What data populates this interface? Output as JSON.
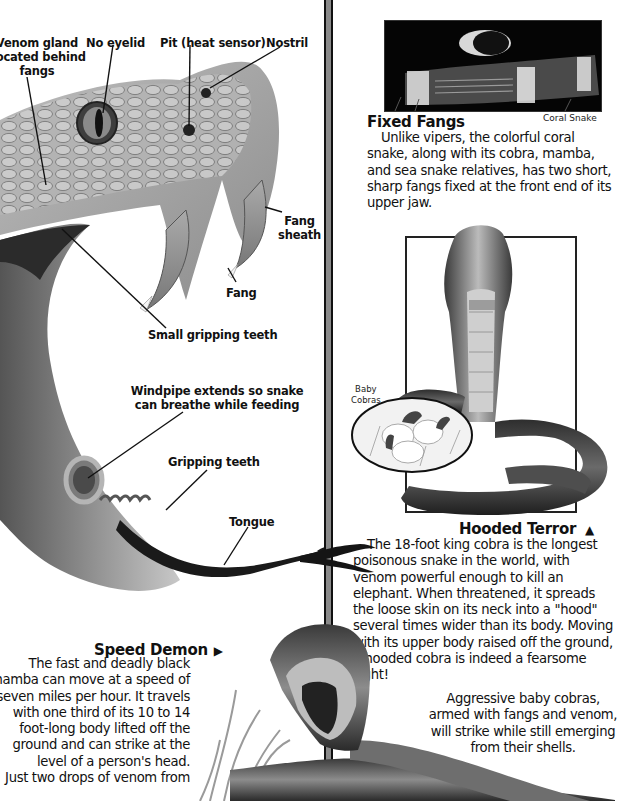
{
  "page": {
    "background": "#ffffff",
    "divider_color": "#8a8a8a"
  },
  "anatomy_diagram": {
    "labels": {
      "venom_gland": [
        "Venom gland",
        "located behind",
        "fangs"
      ],
      "no_eyelid": "No eyelid",
      "pit": "Pit (heat sensor)",
      "nostril": "Nostril",
      "fang_sheath": [
        "Fang",
        "sheath"
      ],
      "fang": "Fang",
      "small_gripping_teeth": "Small gripping teeth",
      "windpipe": [
        "Windpipe extends so snake",
        "can breathe while feeding"
      ],
      "gripping_teeth": "Gripping teeth",
      "tongue": "Tongue"
    }
  },
  "fixed_fangs": {
    "photo_caption": "Coral Snake",
    "heading": "Fixed Fangs",
    "text": "Unlike vipers, the colorful coral snake, along with its cobra, mamba, and sea snake relatives, has two short, sharp fangs fixed at the front end of its upper jaw."
  },
  "hooded_terror": {
    "inset_caption": [
      "Baby",
      "Cobras"
    ],
    "heading": "Hooded Terror",
    "heading_icon": "triangle-up-icon",
    "text": "The 18-foot king cobra is the longest poisonous snake in the world, with venom powerful enough to kill an elephant. When threatened, it spreads the loose skin on its neck into a \"hood\" several times wider than its body. Moving with its upper body raised off the ground, a hooded cobra is indeed a fearsome sight!",
    "baby_text": "Aggressive baby cobras, armed with fangs and venom, will strike while still emerging from their shells."
  },
  "speed_demon": {
    "heading": "Speed Demon",
    "heading_icon": "triangle-right-icon",
    "lines": [
      "The fast and deadly black",
      "mamba can move at a speed of",
      "seven miles per hour. It travels",
      "with one third of its 10 to 14",
      "foot-long body lifted off the",
      "ground and can strike at the",
      "level of a person's head.",
      "Just two drops of venom from"
    ]
  }
}
